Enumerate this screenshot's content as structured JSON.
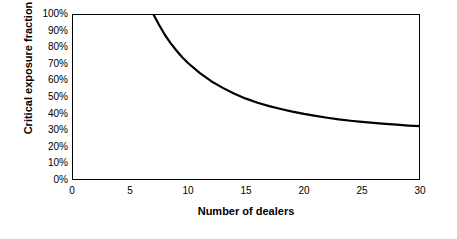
{
  "chart_data": {
    "type": "line",
    "title": "",
    "xlabel": "Number of dealers",
    "ylabel": "Critical exposure fraction",
    "xlim": [
      0,
      30
    ],
    "ylim": [
      0,
      1.0
    ],
    "grid": false,
    "legend": "none",
    "x_ticks": [
      "0",
      "5",
      "10",
      "15",
      "20",
      "25",
      "30"
    ],
    "x_tick_values": [
      0,
      5,
      10,
      15,
      20,
      25,
      30
    ],
    "y_ticks": [
      "0%",
      "10%",
      "20%",
      "30%",
      "40%",
      "50%",
      "60%",
      "70%",
      "80%",
      "90%",
      "100%"
    ],
    "y_tick_values": [
      0,
      0.1,
      0.2,
      0.3,
      0.4,
      0.5,
      0.6,
      0.7,
      0.8,
      0.9,
      1.0
    ],
    "series": [
      {
        "name": "Critical exposure fraction",
        "color": "#000000",
        "x": [
          7,
          7.5,
          8,
          8.5,
          9,
          9.5,
          10,
          11,
          12,
          13,
          14,
          15,
          16,
          17,
          18,
          19,
          20,
          21,
          22,
          23,
          24,
          25,
          26,
          27,
          28,
          29,
          30
        ],
        "y": [
          1.0,
          0.935,
          0.875,
          0.825,
          0.78,
          0.74,
          0.705,
          0.645,
          0.595,
          0.555,
          0.52,
          0.49,
          0.465,
          0.445,
          0.428,
          0.412,
          0.398,
          0.386,
          0.375,
          0.365,
          0.357,
          0.35,
          0.344,
          0.338,
          0.333,
          0.328,
          0.324
        ]
      }
    ]
  }
}
